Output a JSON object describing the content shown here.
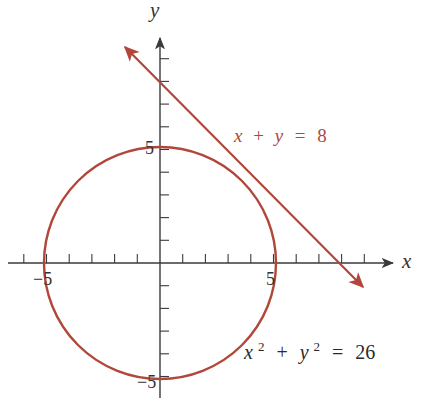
{
  "chart_data": {
    "type": "line",
    "title": "",
    "xlabel": "x",
    "ylabel": "y",
    "xlim": [
      -6.7,
      10.3
    ],
    "ylim": [
      -5.9,
      10
    ],
    "tick_step": 1,
    "tick_labels": {
      "x": [
        "-5",
        "5"
      ],
      "y": [
        "5",
        "-5"
      ]
    },
    "series": [
      {
        "name": "x + y = 8",
        "kind": "line",
        "equation": "x + y = 8",
        "color": "#b0473a",
        "arrows": "both",
        "x_intercept": 8,
        "y_intercept": 8,
        "endpoints": [
          [
            -1.8,
            9.8
          ],
          [
            9.6,
            -1.5
          ]
        ]
      },
      {
        "name": "x^2 + y^2 = 26",
        "kind": "circle",
        "equation": "x^2 + y^2 = 26",
        "color": "#b0473a",
        "center": [
          0,
          0
        ],
        "radius": 5.099
      }
    ],
    "annotations": [
      {
        "text": "x + y = 8",
        "near": "line",
        "position": [
          3.3,
          5.3
        ]
      },
      {
        "text": "x² + y² = 26",
        "near": "circle",
        "position": [
          3.8,
          -4
        ]
      }
    ],
    "grid": false,
    "legend": "none"
  },
  "labels": {
    "x_axis": "x",
    "y_axis": "y",
    "x_neg5": "−5",
    "x_pos5": "5",
    "y_pos5": "5",
    "y_neg5": "−5",
    "line_eq": {
      "lhs1": "x",
      "plus": "+",
      "lhs2": "y",
      "eq": "=",
      "rhs": "8"
    },
    "circle_eq": {
      "x": "x",
      "x_exp": "2",
      "plus": "+",
      "y": "y",
      "y_exp": "2",
      "eq": "=",
      "rhs": "26"
    }
  },
  "colors": {
    "curve": "#b0473a",
    "axis": "#3a3a3a",
    "background": "#ffffff"
  }
}
